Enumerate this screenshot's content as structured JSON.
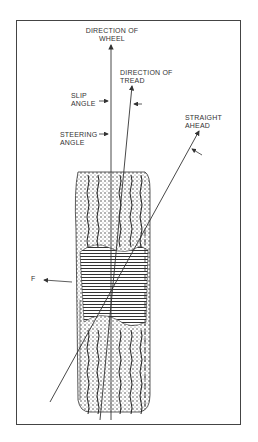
{
  "diagram": {
    "labels": {
      "direction_of_wheel": [
        "DIRECTION OF",
        "WHEEL"
      ],
      "direction_of_tread": [
        "DIRECTION OF",
        "TREAD"
      ],
      "slip_angle": [
        "SLIP",
        "ANGLE"
      ],
      "steering_angle": [
        "STEERING",
        "ANGLE"
      ],
      "straight_ahead": [
        "STRAIGHT",
        "AHEAD"
      ],
      "force": "F"
    },
    "colors": {
      "line": "#333333",
      "background": "#ffffff"
    }
  }
}
